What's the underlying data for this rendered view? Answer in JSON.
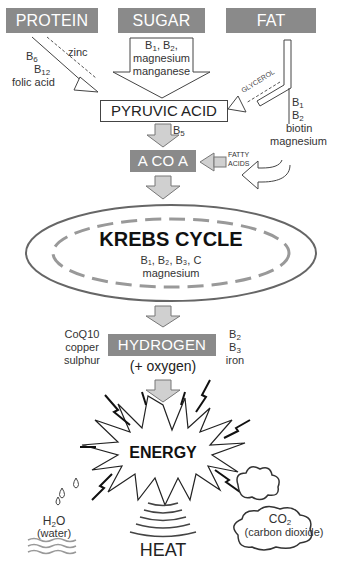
{
  "sources": {
    "protein": "PROTEIN",
    "sugar": "SUGAR",
    "fat": "FAT"
  },
  "protein_cofactors": {
    "line1": "B",
    "line1_sub": "6",
    "line2": "B",
    "line2_sub": "12",
    "line3": "folic acid",
    "dashed": "zinc"
  },
  "sugar_cofactors": {
    "line1a": "B",
    "line1a_sub": "1",
    "line1b": ", B",
    "line1b_sub": "2",
    "line1c": ",",
    "line2": "magnesium",
    "line3": "manganese"
  },
  "fat_cofactors": {
    "glycerol": "GLYCEROL",
    "line1": "B",
    "line1_sub": "1",
    "line2": "B",
    "line2_sub": "2",
    "line3": "biotin",
    "line4": "magnesium",
    "fatty_acids_1": "FATTY",
    "fatty_acids_2": "ACIDS"
  },
  "pyruvic": "PYRUVIC ACID",
  "b5": {
    "text": "B",
    "sub": "5"
  },
  "acoa": "A CO A",
  "krebs": {
    "title": "KREBS CYCLE",
    "cof_line1": "B₁, B₂, B₃, C",
    "cof_line2": "magnesium"
  },
  "hydrogen": {
    "title": "HYDROGEN",
    "oxygen": "(+ oxygen)",
    "left": [
      "CoQ10",
      "copper",
      "sulphur"
    ],
    "right_1": "B",
    "right_1_sub": "2",
    "right_2": "B",
    "right_2_sub": "3",
    "right_3": "iron"
  },
  "energy": "ENERGY",
  "outputs": {
    "water_formula": "H",
    "water_sub": "2",
    "water_formula_end": "O",
    "water_label": "(water)",
    "heat": "HEAT",
    "co2_formula": "CO",
    "co2_sub": "2",
    "co2_label": "(carbon dioxide)"
  },
  "colors": {
    "box_gray": "#8a8a8a",
    "arrow_fill": "#d0d0d0",
    "line": "#444444"
  }
}
